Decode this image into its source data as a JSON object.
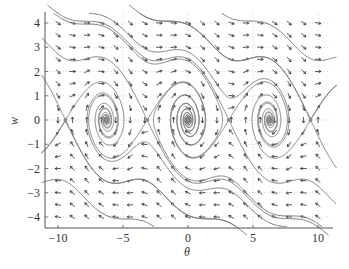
{
  "chart_data": {
    "type": "phase-portrait",
    "title": "",
    "xlabel": "θ",
    "ylabel": "w",
    "xlim": [
      -11,
      11.15
    ],
    "ylim": [
      -4.45,
      4.45
    ],
    "xticks": [
      -10,
      -5,
      0,
      5,
      10
    ],
    "xtick_labels": [
      "−10",
      "−5",
      "0",
      "5",
      "10"
    ],
    "yticks": [
      -4,
      -3,
      -2,
      -1,
      0,
      1,
      2,
      3,
      4
    ],
    "ytick_labels": [
      "−4",
      "−3",
      "−2",
      "−1",
      "0",
      "1",
      "2",
      "3",
      "4"
    ],
    "grid": {
      "on": true,
      "style": "dotted",
      "x_at": [
        -10,
        -5,
        0,
        5,
        10
      ],
      "y_at": [
        -4,
        -3,
        -2,
        -1,
        0,
        1,
        2,
        3,
        4
      ]
    },
    "system": {
      "description": "Damped pendulum: θ' = w, w' = -sin(θ) - b·w",
      "damping_b": 0.25
    },
    "direction_field": {
      "theta_range": [
        -10,
        10
      ],
      "theta_count": 19,
      "w_range": [
        -4,
        4
      ],
      "w_count": 17,
      "arrow_length_px": 6
    },
    "equilibria": {
      "sinks": [
        [
          -6.2832,
          0
        ],
        [
          0,
          0
        ],
        [
          6.2832,
          0
        ]
      ],
      "saddles": [
        [
          -9.4248,
          0
        ],
        [
          -3.1416,
          0
        ],
        [
          3.1416,
          0
        ],
        [
          9.4248,
          0
        ]
      ]
    },
    "trajectories": [
      {
        "start": [
          -10.3,
          4.4
        ],
        "direction": "forward"
      },
      {
        "start": [
          -7.6,
          4.4
        ],
        "direction": "forward"
      },
      {
        "start": [
          -3.7,
          4.4
        ],
        "direction": "forward"
      },
      {
        "start": [
          2.6,
          4.4
        ],
        "direction": "forward"
      },
      {
        "start": [
          10.3,
          -4.4
        ],
        "direction": "forward"
      },
      {
        "start": [
          7.6,
          -4.4
        ],
        "direction": "forward"
      },
      {
        "start": [
          3.7,
          -4.4
        ],
        "direction": "forward"
      },
      {
        "start": [
          -2.6,
          -4.4
        ],
        "direction": "forward"
      }
    ],
    "separatrices_from_saddles": true,
    "colors": {
      "trajectory": "#7a7a7a",
      "arrow": "#2e2e2e",
      "axis": "#555555",
      "grid": "#bdbdbd",
      "equilibrium": "#8a8a8a"
    }
  },
  "layout": {
    "origin_px": [
      188,
      120
    ],
    "px_per_unit_x": 13.0,
    "px_per_unit_y": 24.25,
    "axis_left_px": 45,
    "axis_bottom_px": 228,
    "plot_right_px": 333,
    "plot_top_px": 12
  }
}
